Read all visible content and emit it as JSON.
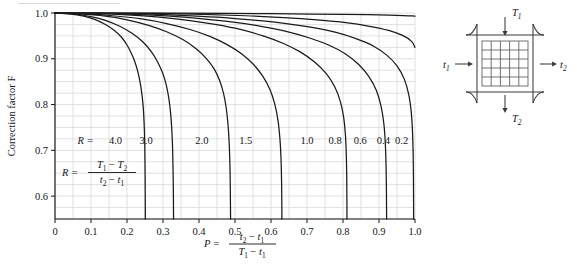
{
  "chart_data": {
    "type": "line",
    "title": "",
    "xlabel": "P = (t2 - t1)/(T1 - t1)",
    "ylabel": "Correction factor F",
    "xlim": [
      0,
      1.0
    ],
    "ylim": [
      0.55,
      1.0
    ],
    "grid": true,
    "grid_spacing_x": 0.05,
    "grid_spacing_y": 0.025,
    "xticks": [
      "0",
      "0.1",
      "0.2",
      "0.3",
      "0.4",
      "0.5",
      "0.6",
      "0.7",
      "0.8",
      "0.9",
      "1.0"
    ],
    "xtick_values": [
      0,
      0.1,
      0.2,
      0.3,
      0.4,
      0.5,
      0.6,
      0.7,
      0.8,
      0.9,
      1.0
    ],
    "yticks": [
      "0.6",
      "0.7",
      "0.8",
      "0.9",
      "1.0"
    ],
    "ytick_values": [
      0.6,
      0.7,
      0.8,
      0.9,
      1.0
    ],
    "legend_position": "inline-on-curves",
    "series": [
      {
        "name": "R = 4.0",
        "label": "4.0",
        "points": [
          [
            0,
            1.0
          ],
          [
            0.04,
            0.998
          ],
          [
            0.08,
            0.993
          ],
          [
            0.11,
            0.986
          ],
          [
            0.14,
            0.975
          ],
          [
            0.165,
            0.962
          ],
          [
            0.185,
            0.947
          ],
          [
            0.2,
            0.93
          ],
          [
            0.212,
            0.912
          ],
          [
            0.222,
            0.893
          ],
          [
            0.23,
            0.872
          ],
          [
            0.236,
            0.85
          ],
          [
            0.241,
            0.825
          ],
          [
            0.245,
            0.795
          ],
          [
            0.2475,
            0.76
          ],
          [
            0.2492,
            0.72
          ],
          [
            0.25,
            0.672
          ],
          [
            0.2505,
            0.62
          ],
          [
            0.2508,
            0.57
          ],
          [
            0.251,
            0.55
          ]
        ]
      },
      {
        "name": "R = 3.0",
        "label": "3.0",
        "points": [
          [
            0,
            1.0
          ],
          [
            0.05,
            0.998
          ],
          [
            0.1,
            0.992
          ],
          [
            0.14,
            0.984
          ],
          [
            0.18,
            0.971
          ],
          [
            0.215,
            0.955
          ],
          [
            0.245,
            0.936
          ],
          [
            0.268,
            0.915
          ],
          [
            0.285,
            0.893
          ],
          [
            0.299,
            0.869
          ],
          [
            0.309,
            0.843
          ],
          [
            0.3165,
            0.812
          ],
          [
            0.3215,
            0.778
          ],
          [
            0.3248,
            0.74
          ],
          [
            0.3268,
            0.7
          ],
          [
            0.328,
            0.655
          ],
          [
            0.3288,
            0.605
          ],
          [
            0.3292,
            0.565
          ],
          [
            0.3294,
            0.55
          ]
        ]
      },
      {
        "name": "R = 2.0",
        "label": "2.0",
        "points": [
          [
            0,
            1.0
          ],
          [
            0.07,
            0.998
          ],
          [
            0.14,
            0.993
          ],
          [
            0.2,
            0.985
          ],
          [
            0.26,
            0.973
          ],
          [
            0.31,
            0.959
          ],
          [
            0.355,
            0.942
          ],
          [
            0.392,
            0.922
          ],
          [
            0.42,
            0.901
          ],
          [
            0.442,
            0.878
          ],
          [
            0.457,
            0.853
          ],
          [
            0.468,
            0.825
          ],
          [
            0.4755,
            0.793
          ],
          [
            0.4805,
            0.757
          ],
          [
            0.4838,
            0.716
          ],
          [
            0.4858,
            0.672
          ],
          [
            0.4868,
            0.625
          ],
          [
            0.4874,
            0.58
          ],
          [
            0.4877,
            0.55
          ]
        ]
      },
      {
        "name": "R = 1.5",
        "label": "1.5",
        "points": [
          [
            0,
            1.0
          ],
          [
            0.08,
            0.998
          ],
          [
            0.16,
            0.994
          ],
          [
            0.24,
            0.987
          ],
          [
            0.31,
            0.977
          ],
          [
            0.375,
            0.964
          ],
          [
            0.43,
            0.949
          ],
          [
            0.478,
            0.931
          ],
          [
            0.518,
            0.911
          ],
          [
            0.551,
            0.888
          ],
          [
            0.577,
            0.862
          ],
          [
            0.597,
            0.833
          ],
          [
            0.6105,
            0.801
          ],
          [
            0.6195,
            0.765
          ],
          [
            0.6248,
            0.725
          ],
          [
            0.6278,
            0.682
          ],
          [
            0.6293,
            0.635
          ],
          [
            0.63,
            0.588
          ],
          [
            0.6303,
            0.55
          ]
        ]
      },
      {
        "name": "R = 1.0",
        "label": "1.0",
        "points": [
          [
            0,
            1.0
          ],
          [
            0.1,
            0.999
          ],
          [
            0.2,
            0.996
          ],
          [
            0.29,
            0.991
          ],
          [
            0.37,
            0.984
          ],
          [
            0.445,
            0.975
          ],
          [
            0.515,
            0.964
          ],
          [
            0.578,
            0.95
          ],
          [
            0.633,
            0.934
          ],
          [
            0.681,
            0.915
          ],
          [
            0.721,
            0.893
          ],
          [
            0.753,
            0.868
          ],
          [
            0.777,
            0.839
          ],
          [
            0.7925,
            0.807
          ],
          [
            0.8018,
            0.772
          ],
          [
            0.8068,
            0.733
          ],
          [
            0.8092,
            0.69
          ],
          [
            0.8103,
            0.645
          ],
          [
            0.8108,
            0.598
          ],
          [
            0.811,
            0.55
          ]
        ]
      },
      {
        "name": "R = 0.8",
        "label": "0.8",
        "points": [
          [
            0,
            1.0
          ],
          [
            0.11,
            0.999
          ],
          [
            0.22,
            0.997
          ],
          [
            0.32,
            0.993
          ],
          [
            0.41,
            0.987
          ],
          [
            0.495,
            0.98
          ],
          [
            0.572,
            0.971
          ],
          [
            0.642,
            0.96
          ],
          [
            0.705,
            0.946
          ],
          [
            0.76,
            0.93
          ],
          [
            0.806,
            0.911
          ],
          [
            0.843,
            0.888
          ],
          [
            0.872,
            0.861
          ],
          [
            0.8925,
            0.831
          ],
          [
            0.9055,
            0.797
          ],
          [
            0.9135,
            0.758
          ],
          [
            0.9175,
            0.716
          ],
          [
            0.9195,
            0.67
          ],
          [
            0.9205,
            0.62
          ],
          [
            0.921,
            0.57
          ],
          [
            0.9212,
            0.55
          ]
        ]
      },
      {
        "name": "R = 0.6",
        "label": "0.6",
        "points": [
          [
            0,
            1.0
          ],
          [
            0.12,
            0.9995
          ],
          [
            0.24,
            0.998
          ],
          [
            0.35,
            0.995
          ],
          [
            0.45,
            0.991
          ],
          [
            0.545,
            0.985
          ],
          [
            0.632,
            0.978
          ],
          [
            0.71,
            0.969
          ],
          [
            0.778,
            0.958
          ],
          [
            0.836,
            0.944
          ],
          [
            0.884,
            0.928
          ],
          [
            0.9215,
            0.908
          ],
          [
            0.9505,
            0.884
          ],
          [
            0.9705,
            0.855
          ],
          [
            0.9825,
            0.822
          ],
          [
            0.9895,
            0.784
          ],
          [
            0.993,
            0.742
          ],
          [
            0.9948,
            0.695
          ],
          [
            0.9956,
            0.645
          ],
          [
            0.996,
            0.595
          ],
          [
            0.9962,
            0.55
          ]
        ]
      },
      {
        "name": "R = 0.4",
        "label": "0.4",
        "points": [
          [
            0,
            1.0
          ],
          [
            0.14,
            0.9997
          ],
          [
            0.28,
            0.999
          ],
          [
            0.41,
            0.997
          ],
          [
            0.53,
            0.994
          ],
          [
            0.635,
            0.99
          ],
          [
            0.728,
            0.985
          ],
          [
            0.808,
            0.979
          ],
          [
            0.874,
            0.971
          ],
          [
            0.9265,
            0.962
          ],
          [
            0.9655,
            0.951
          ],
          [
            0.9905,
            0.938
          ],
          [
            1.0,
            0.925
          ]
        ]
      },
      {
        "name": "R = 0.2",
        "label": "0.2",
        "points": [
          [
            0,
            1.0
          ],
          [
            0.16,
            0.9999
          ],
          [
            0.32,
            0.9996
          ],
          [
            0.47,
            0.9991
          ],
          [
            0.6,
            0.9985
          ],
          [
            0.71,
            0.9978
          ],
          [
            0.8,
            0.997
          ],
          [
            0.872,
            0.9962
          ],
          [
            0.928,
            0.9953
          ],
          [
            0.968,
            0.9944
          ],
          [
            0.992,
            0.9936
          ],
          [
            1.0,
            0.993
          ]
        ]
      }
    ],
    "curve_labels": [
      {
        "text": "R =",
        "x": 0.085,
        "y": 0.713
      },
      {
        "text": "4.0",
        "x": 0.168,
        "y": 0.713
      },
      {
        "text": "3.0",
        "x": 0.253,
        "y": 0.713
      },
      {
        "text": "2.0",
        "x": 0.408,
        "y": 0.713
      },
      {
        "text": "1.5",
        "x": 0.53,
        "y": 0.713
      },
      {
        "text": "1.0",
        "x": 0.7,
        "y": 0.713
      },
      {
        "text": "0.8",
        "x": 0.778,
        "y": 0.713
      },
      {
        "text": "0.6",
        "x": 0.848,
        "y": 0.713
      },
      {
        "text": "0.4",
        "x": 0.912,
        "y": 0.713
      },
      {
        "text": "0.2",
        "x": 0.963,
        "y": 0.713
      }
    ],
    "annotation_R": {
      "lhs": "R =",
      "numerator": "T1 - T2",
      "denominator": "t2 - t1"
    },
    "annotation_P": {
      "lhs": "P =",
      "numerator": "t2 - t1",
      "denominator": "T1 - t1"
    }
  },
  "axes": {
    "y_axis_title": "Correction factor F",
    "x_axis_symbol": "P"
  },
  "diagram": {
    "name": "crossflow-heat-exchanger",
    "inlet_top": "T1",
    "outlet_bottom": "T2",
    "inlet_left": "t1",
    "outlet_right": "t2",
    "grid_rows": 5,
    "grid_cols": 5
  },
  "colors": {
    "curve": "#1a1a1a",
    "grid": "#d9d9d9",
    "axis": "#15151a",
    "background": "#ffffff",
    "diagram_line": "#3a3a3a"
  }
}
